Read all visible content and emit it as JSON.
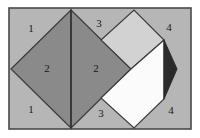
{
  "figure": {
    "name": "pythagorean-dissection-diagram",
    "canvas": {
      "width": 200,
      "height": 138
    },
    "frame": {
      "x": 9,
      "y": 8,
      "width": 182,
      "height": 121,
      "fill": "#b6b6b6",
      "stroke": "#4a4a4a",
      "stroke_width": 1.6
    },
    "palette": {
      "background_gray": "#b6b6b6",
      "dark_gray": "#8a8a8a",
      "light_gray": "#d2d2d2",
      "white": "#fbfbfb",
      "near_black": "#2b2b2b",
      "outline": "#3c3c3c",
      "label_color": "#1a1a1a"
    },
    "shapes": [
      {
        "name": "left-square-half-west",
        "points": "11,69 71,10 71,128",
        "fill": "#8a8a8a",
        "stroke": "#3c3c3c",
        "stroke_width": 1.2
      },
      {
        "name": "left-square-half-east",
        "points": "71,10 131,69 71,128",
        "fill": "#8a8a8a",
        "stroke": "#3c3c3c",
        "stroke_width": 1.2
      },
      {
        "name": "upper-light-square",
        "points": "101,40 134,10 164,40 131,69",
        "fill": "#d2d2d2",
        "stroke": "#3c3c3c",
        "stroke_width": 1.2
      },
      {
        "name": "lower-white-square",
        "points": "101,98 131,69 164,40 164,99 134,128",
        "fill": "#fbfbfb",
        "stroke": "#3c3c3c",
        "stroke_width": 1.2
      },
      {
        "name": "right-dark-triangle",
        "points": "164,40 177,69 164,99",
        "fill": "#2b2b2b",
        "stroke": "#2b2b2b",
        "stroke_width": 1.0
      }
    ],
    "center_divider": {
      "name": "central-vertical-divider",
      "x1": 71,
      "y1": 10,
      "x2": 71,
      "y2": 128,
      "stroke": "#2f2f2f",
      "stroke_width": 1.4
    },
    "labels": [
      {
        "name": "region-label-1-top",
        "text": "1",
        "x": 31,
        "y": 29,
        "tone": "light"
      },
      {
        "name": "region-label-2-left",
        "text": "2",
        "x": 47,
        "y": 69,
        "tone": "dark"
      },
      {
        "name": "region-label-1-bottom",
        "text": "1",
        "x": 31,
        "y": 110,
        "tone": "light"
      },
      {
        "name": "region-label-3-top",
        "text": "3",
        "x": 99,
        "y": 24,
        "tone": "light"
      },
      {
        "name": "region-label-2-right",
        "text": "2",
        "x": 96,
        "y": 69,
        "tone": "dark"
      },
      {
        "name": "region-label-3-bottom",
        "text": "3",
        "x": 101,
        "y": 114,
        "tone": "light"
      },
      {
        "name": "region-label-4-top",
        "text": "4",
        "x": 169,
        "y": 28,
        "tone": "light"
      },
      {
        "name": "region-label-4-bottom",
        "text": "4",
        "x": 171,
        "y": 111,
        "tone": "light"
      }
    ]
  }
}
